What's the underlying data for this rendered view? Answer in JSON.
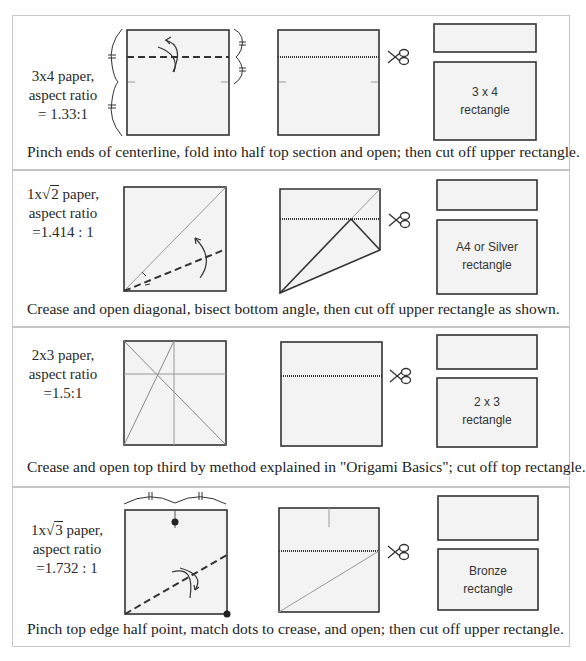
{
  "colors": {
    "paper_fill": "#f3f3f3",
    "stroke": "#333333",
    "crease": "#9a9a9a",
    "frame": "#c8c8c8"
  },
  "panels": [
    {
      "id": "3x4",
      "label_line1": "3x4 paper,",
      "label_line2": "aspect ratio",
      "label_line3": "= 1.33:1",
      "result_line1": "3 x 4",
      "result_line2": "rectangle",
      "caption": "Pinch ends of centerline, fold into half top section and open; then cut off upper rectangle.",
      "icons": [
        "fold-arrow-icon",
        "scissors-icon",
        "equal-mark-icon",
        "brace-icon"
      ]
    },
    {
      "id": "sqrt2",
      "label_prefix": "1x",
      "label_radicand": "2",
      "label_suffix": " paper,",
      "label_line2": "aspect ratio",
      "label_line3": "=1.414 : 1",
      "result_line1": "A4 or Silver",
      "result_line2": "rectangle",
      "caption": "Crease and open diagonal, bisect bottom angle, then cut off upper rectangle as shown.",
      "icons": [
        "fold-arrow-icon",
        "scissors-icon",
        "angle-bisect-icon"
      ]
    },
    {
      "id": "2x3",
      "label_line1": "2x3 paper,",
      "label_line2": "aspect ratio",
      "label_line3": "=1.5:1",
      "result_line1": "2 x 3",
      "result_line2": "rectangle",
      "caption": "Crease and  open top third by method explained in \"Origami Basics\";  cut off top rectangle.",
      "icons": [
        "scissors-icon"
      ]
    },
    {
      "id": "sqrt3",
      "label_prefix": "1x",
      "label_radicand": "3",
      "label_suffix": " paper,",
      "label_line2": "aspect ratio",
      "label_line3": "=1.732 : 1",
      "result_line1": "Bronze",
      "result_line2": "rectangle",
      "caption": "Pinch top edge half point,  match dots to crease, and open; then cut off upper rectangle.",
      "icons": [
        "fold-arrow-icon",
        "scissors-icon",
        "dot-marker-icon",
        "equal-mark-icon"
      ]
    }
  ]
}
